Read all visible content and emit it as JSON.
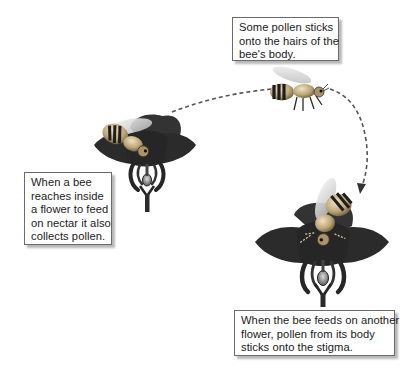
{
  "diagram": {
    "labels": {
      "top": {
        "lines": [
          "Some pollen sticks",
          "onto the hairs of the",
          "bee's body."
        ]
      },
      "left": {
        "lines": [
          "When a bee",
          "reaches inside",
          "a flower to feed",
          "on nectar it also",
          "collects pollen."
        ]
      },
      "bottom": {
        "lines": [
          "When the bee feeds on another",
          "flower, pollen from its body",
          "sticks onto the stigma."
        ]
      }
    },
    "figures": [
      {
        "id": "flower-1",
        "description": "flower with bee feeding on nectar"
      },
      {
        "id": "bee-flying",
        "description": "bee in flight carrying pollen"
      },
      {
        "id": "flower-2",
        "description": "second flower with bee depositing pollen on stigma"
      }
    ],
    "arrows": [
      {
        "from": "flower-1",
        "to": "bee-flying",
        "style": "dashed"
      },
      {
        "from": "bee-flying",
        "to": "flower-2",
        "style": "dashed",
        "arrowhead": true
      }
    ],
    "colors": {
      "petal": "#2b2b2b",
      "bee_body": "#c9b48a",
      "bee_stripe": "#1e1e1e",
      "wing": "#e3e3e3",
      "arrow": "#555555",
      "box_border": "#6b6b6b"
    }
  }
}
